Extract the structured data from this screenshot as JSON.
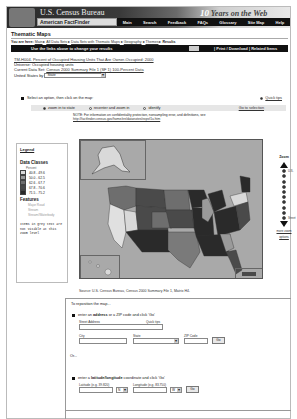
{
  "header": {
    "agency": "U.S. Census Bureau",
    "product": "American FactFinder",
    "tagline_number": "10",
    "tagline": "Years on the Web",
    "nav": [
      "Main",
      "Search",
      "Feedback",
      "FAQs",
      "Glossary",
      "Site Map",
      "Help"
    ]
  },
  "page": {
    "title": "Thematic Maps",
    "breadcrumb_prefix": "You are here:",
    "breadcrumb": [
      "Main",
      "All Data Sets",
      "Data Sets with Thematic Maps",
      "Geography",
      "Themes",
      "Results"
    ],
    "bar_message": "Use the links above to change your results",
    "bar_links": "| Print / Download | Related Items"
  },
  "info": {
    "map_title": "TM-H004. Percent of Occupied Housing Units That Are Owner-Occupied: 2000",
    "universe": "Universe: Occupied housing units",
    "dataset_label": "Current Data Set:",
    "dataset": "Census 2000 Summary File 1 (SF 1) 100-Percent Data",
    "geo_label": "United States by",
    "geo_value": "State"
  },
  "options": {
    "prompt": "Select an option, then click on the map:",
    "quick_tips": "Quick tips",
    "doc_link": "Go to selection",
    "radios": [
      {
        "label": "zoom in to state",
        "checked": true
      },
      {
        "label": "recenter and zoom in",
        "checked": false
      },
      {
        "label": "identify",
        "checked": false
      }
    ],
    "note": "NOTE: For information on confidentiality protection, nonsampling error, and definitions, see",
    "note_link": "http://factfinder.census.gov/home/en/datanotes/expsf1u.htm"
  },
  "legend": {
    "title": "Legend",
    "classes_title": "Data Classes",
    "unit": "Percent",
    "classes": [
      {
        "range": "40.8 - 49.6",
        "color": "#d9d9d9"
      },
      {
        "range": "50.0 - 62.5",
        "color": "#9a9a9a"
      },
      {
        "range": "62.6 - 67.7",
        "color": "#6e6e6e"
      },
      {
        "range": "67.8 - 70.6",
        "color": "#4a4a4a"
      },
      {
        "range": "71.5 - 75.2",
        "color": "#2a2a2a"
      }
    ],
    "features_title": "Features",
    "features": [
      "Major Road",
      "Stream",
      "Stream/Waterbody"
    ],
    "footnote": "Items in grey text are not visible at this zoom level"
  },
  "map": {
    "source": "Source: U.S. Census Bureau, Census 2000 Summary File 1, Matrix H4."
  },
  "zoom": {
    "label": "Zoom",
    "top_label": "U.S.",
    "bottom_label": "Street",
    "levels": 10,
    "links": [
      "more zoom",
      "options"
    ]
  },
  "reposition": {
    "heading": "To reposition the map...",
    "address_prompt_pre": "enter an ",
    "address_bold": "address",
    "address_prompt_post": " or a ZIP code and click 'Go'",
    "street_label": "Street Address",
    "quick_tips": "Quick tips",
    "city_label": "City",
    "state_label": "State",
    "zip_label": "ZIP Code",
    "go": "Go",
    "or": "Or...",
    "latlon_prompt_pre": "enter a ",
    "latlon_bold": "latitude/longitude",
    "latlon_prompt_post": " coordinate and click 'Go'",
    "lat_label": "Latitude (e.g. 39.820)",
    "lon_label": "Longitude (e.g. 83.750)",
    "lat_dir": "N",
    "lon_dir": "W"
  }
}
